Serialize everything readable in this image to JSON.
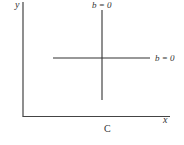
{
  "diagram": {
    "axes": {
      "y_label": "y",
      "x_label": "x"
    },
    "lines": [
      {
        "id": "vertical",
        "label": "b = 0"
      },
      {
        "id": "horizontal",
        "label": "b = 0"
      }
    ],
    "caption": "C",
    "colors": {
      "line": "#333333",
      "background": "#ffffff"
    }
  }
}
